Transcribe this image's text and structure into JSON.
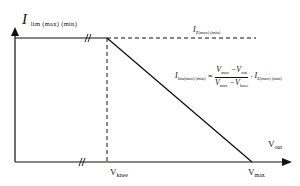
{
  "diagram": {
    "y_axis_label": {
      "main": "I",
      "sub": "lim (max) (min)"
    },
    "x_axis_label": {
      "main": "V",
      "sub": "out"
    },
    "top_line_label": {
      "main": "I",
      "sub": "Z(max) (min)"
    },
    "formula": {
      "lhs_main": "I",
      "lhs_sub": "lim(max) (min)",
      "equals": "=",
      "num_a_main": "V",
      "num_a_sub": "max",
      "num_minus": "−",
      "num_b_main": "V",
      "num_b_sub": "out",
      "den_a_main": "V",
      "den_a_sub": "max",
      "den_minus": "−",
      "den_b_main": "V",
      "den_b_sub": "knee",
      "dot": "·",
      "rhs_main": "I",
      "rhs_sub": "Z(max) (min)"
    },
    "x_ticks": [
      {
        "main": "V",
        "sub": "knee"
      },
      {
        "main": "V",
        "sub": "max"
      }
    ],
    "break_marks": [
      "//",
      "//"
    ],
    "colors": {
      "line": "#111111",
      "background": "#ffffff"
    }
  }
}
